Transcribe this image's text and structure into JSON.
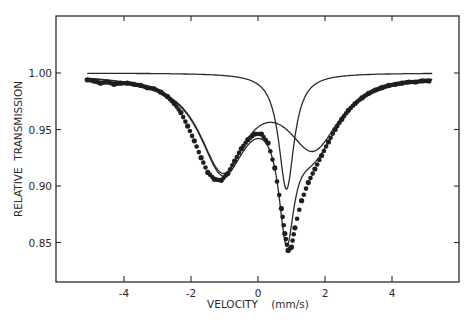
{
  "chart_data": {
    "type": "scatter",
    "title": "",
    "xlabel": "VELOCITY    (mm/s)",
    "ylabel": "RELATIVE  TRANSMISSION",
    "xlim": [
      -6.0,
      6.0
    ],
    "ylim": [
      0.815,
      1.05
    ],
    "grid": false,
    "legend": null,
    "x_ticks": [
      -4,
      -2,
      0,
      2,
      4
    ],
    "x_tick_labels": [
      "-4",
      "-2",
      "0",
      "2",
      "4"
    ],
    "y_ticks": [
      1.0,
      0.95,
      0.9,
      0.85
    ],
    "y_tick_labels": [
      "1.00",
      "0.95",
      "0.90",
      "0.85"
    ],
    "series": [
      {
        "name": "Measured spectrum",
        "kind": "points",
        "x": [
          -5.1,
          -4.9,
          -4.7,
          -4.5,
          -4.3,
          -4.1,
          -3.9,
          -3.7,
          -3.5,
          -3.3,
          -3.1,
          -2.9,
          -2.7,
          -2.5,
          -2.3,
          -2.1,
          -1.9,
          -1.7,
          -1.5,
          -1.3,
          -1.1,
          -0.9,
          -0.7,
          -0.5,
          -0.3,
          -0.1,
          0.1,
          0.3,
          0.5,
          0.7,
          0.8,
          0.9,
          1.0,
          1.1,
          1.3,
          1.5,
          1.7,
          1.9,
          2.1,
          2.3,
          2.5,
          2.7,
          2.9,
          3.1,
          3.3,
          3.5,
          3.7,
          3.9,
          4.1,
          4.3,
          4.5,
          4.7,
          4.9,
          5.1
        ],
        "y": [
          0.994,
          0.993,
          0.991,
          0.992,
          0.99,
          0.991,
          0.991,
          0.99,
          0.989,
          0.987,
          0.986,
          0.983,
          0.979,
          0.973,
          0.965,
          0.953,
          0.94,
          0.925,
          0.912,
          0.906,
          0.905,
          0.911,
          0.922,
          0.933,
          0.941,
          0.946,
          0.946,
          0.938,
          0.916,
          0.88,
          0.858,
          0.843,
          0.846,
          0.863,
          0.887,
          0.903,
          0.915,
          0.927,
          0.939,
          0.95,
          0.959,
          0.967,
          0.973,
          0.978,
          0.982,
          0.985,
          0.987,
          0.989,
          0.99,
          0.991,
          0.992,
          0.992,
          0.993,
          0.993
        ]
      },
      {
        "name": "Total fit",
        "kind": "line",
        "description": "Sum of broad doublet and sharp singlet"
      },
      {
        "name": "Sharp singlet component",
        "kind": "line",
        "center": 0.85,
        "minimum": 0.897,
        "baseline": 1.0
      },
      {
        "name": "Broad doublet component",
        "kind": "line",
        "line_positions": [
          -1.05,
          1.65
        ],
        "minima": [
          0.905,
          0.922
        ],
        "central_maximum": 0.959,
        "baseline": 1.0
      }
    ],
    "model": {
      "baseline": 1.0,
      "singlet": {
        "center": 0.85,
        "depth": 0.103,
        "hwhm": 0.28
      },
      "doublet": [
        {
          "center": -1.05,
          "depth": 0.082,
          "hwhm": 0.85
        },
        {
          "center": 1.65,
          "depth": 0.062,
          "hwhm": 0.95
        }
      ]
    }
  },
  "axes": {
    "x_label": "VELOCITY    (mm/s)",
    "y_label": "RELATIVE  TRANSMISSION"
  },
  "colors": {
    "ink": "#2a2a2a",
    "points": "#1e1e1e",
    "background": "#ffffff"
  }
}
